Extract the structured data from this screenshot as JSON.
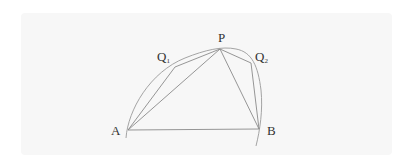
{
  "diagram": {
    "points": {
      "A": {
        "label": "A",
        "x": 128,
        "y": 130
      },
      "B": {
        "label": "B",
        "x": 259,
        "y": 129
      },
      "P": {
        "label": "P",
        "x": 220,
        "y": 49
      },
      "Q1": {
        "label": "Q",
        "sub": "1",
        "x": 175,
        "y": 67
      },
      "Q2": {
        "label": "Q",
        "sub": "2",
        "x": 251,
        "y": 63
      }
    },
    "colors": {
      "line": "#8a8a8a",
      "arc": "#9a9a9a",
      "label": "#333333",
      "panel": "#f7f7f7"
    }
  }
}
